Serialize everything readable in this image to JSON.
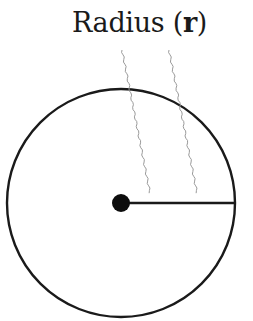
{
  "diagram": {
    "label_prefix": "Radius (",
    "label_symbol": "r",
    "label_suffix": ")",
    "colors": {
      "stroke": "#1a1a1a",
      "leader_lines": "#9a9a9a",
      "background": "#ffffff"
    },
    "circle": {
      "cx": 121,
      "cy": 203,
      "r": 115
    },
    "center_dot": {
      "cx": 121,
      "cy": 203,
      "r": 9
    },
    "radius_line": {
      "x1": 121,
      "y1": 203,
      "x2": 236,
      "y2": 203
    }
  }
}
